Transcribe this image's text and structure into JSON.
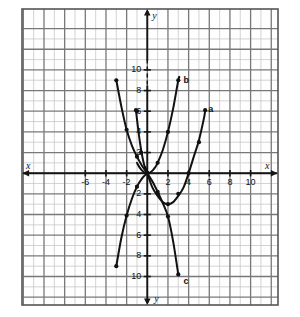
{
  "figure": {
    "kind": "coordinate-grid-plot",
    "background_color": "#ffffff",
    "grid_color": "#b9b9b9",
    "major_grid_color": "#6e6e6e",
    "axis_color": "#1a1a1a",
    "curve_color": "#111111",
    "border_color": "#555555"
  },
  "axes": {
    "x_letter": "x",
    "y_letter": "y",
    "x_letter_left": "x",
    "y_letter_bottom": "y",
    "x_min": -8,
    "x_max": 10,
    "y_min": -11,
    "y_max": 12,
    "x_tick_labels_left": [
      "-6",
      "-4",
      "-2"
    ],
    "x_tick_values_left": [
      -6,
      -4,
      -2
    ],
    "x_tick_labels_right": [
      "2",
      "4",
      "6",
      "8",
      "10"
    ],
    "x_tick_values_right": [
      2,
      4,
      6,
      8,
      10
    ],
    "y_tick_labels_up": [
      "2",
      "4",
      "6",
      "8",
      "10"
    ],
    "y_tick_values_up": [
      2,
      4,
      6,
      8,
      10
    ],
    "y_tick_labels_down": [
      "2",
      "4",
      "6",
      "8",
      "10"
    ],
    "y_tick_values_down": [
      -2,
      -4,
      -6,
      -8,
      -10
    ]
  },
  "curve_labels": [
    {
      "id": "a",
      "text": "a",
      "x": 5.9,
      "y": 6.6
    },
    {
      "id": "b",
      "text": "b",
      "x": 3.5,
      "y": 9.4
    },
    {
      "id": "c",
      "text": "c",
      "x": 3.5,
      "y": -10.0
    }
  ],
  "chart_data": {
    "type": "line",
    "title": "",
    "xlabel": "x",
    "ylabel": "y",
    "xlim": [
      -8,
      10
    ],
    "ylim": [
      -11,
      12
    ],
    "grid": true,
    "legend": "inline-curve-labels",
    "series": [
      {
        "name": "a",
        "label": "a",
        "description": "upward parabola, vertex near (2,-3), passes through origin and (4,0)",
        "marked_points": [
          [
            0,
            0
          ],
          [
            1,
            -2
          ],
          [
            2,
            -3
          ],
          [
            3,
            -2
          ],
          [
            4,
            0
          ],
          [
            5,
            3
          ],
          [
            5.6,
            6.1
          ]
        ],
        "x": [
          -0.2,
          0,
          0.5,
          1,
          1.5,
          2,
          2.5,
          3,
          3.5,
          4,
          4.5,
          5,
          5.5,
          5.6
        ],
        "y": [
          0.6,
          0,
          -1.4,
          -2.2,
          -2.8,
          -3.0,
          -2.8,
          -2.2,
          -1.4,
          0,
          1.6,
          3.2,
          5.4,
          6.1
        ]
      },
      {
        "name": "b",
        "label": "b",
        "description": "narrow upward parabola, vertex at origin, through (1,1),(2,4),(3,9)",
        "marked_points": [
          [
            0,
            0
          ],
          [
            1,
            1
          ],
          [
            2,
            4
          ],
          [
            3,
            9
          ]
        ],
        "x": [
          -1,
          -0.75,
          -0.5,
          -0.25,
          0,
          0.25,
          0.5,
          0.75,
          1,
          1.5,
          2,
          2.5,
          3,
          3.1
        ],
        "y": [
          1,
          0.56,
          0.25,
          0.06,
          0,
          0.06,
          0.25,
          0.56,
          1,
          2.25,
          4,
          6.25,
          9,
          9.3
        ]
      },
      {
        "name": "c",
        "label": "c",
        "description": "downward steep curve from upper-left (-3,9) through origin to lower-right (3,-10)",
        "marked_points": [
          [
            -3,
            9
          ],
          [
            -2,
            4.2
          ],
          [
            -1,
            1.6
          ],
          [
            0,
            0
          ],
          [
            1,
            -1.8
          ],
          [
            2,
            -4.2
          ],
          [
            3,
            -9.8
          ]
        ],
        "x": [
          -3,
          -2.5,
          -2,
          -1.5,
          -1,
          -0.5,
          0,
          0.5,
          1,
          1.5,
          2,
          2.5,
          3
        ],
        "y": [
          9,
          6.4,
          4.2,
          2.7,
          1.6,
          0.7,
          0,
          -0.8,
          -1.8,
          -2.9,
          -4.2,
          -6.6,
          -9.8
        ]
      },
      {
        "name": "d",
        "label": "",
        "description": "rising steep curve from lower-left (-3,-9) through origin up to (-1,6) branch; S-shaped cubic-like pair",
        "marked_points": [
          [
            -3,
            -9
          ],
          [
            -2,
            -4.1
          ],
          [
            -1,
            -1.3
          ],
          [
            0,
            0
          ],
          [
            -1,
            6
          ]
        ],
        "x": [
          -3,
          -2.5,
          -2,
          -1.5,
          -1,
          -0.5,
          0
        ],
        "y": [
          -9,
          -6.2,
          -4.1,
          -2.5,
          -1.3,
          -0.5,
          0
        ]
      },
      {
        "name": "e",
        "label": "",
        "description": "left descending branch from (-1,6) to origin (part of narrow parabola b mirrored / separate steep curve)",
        "marked_points": [
          [
            -1.1,
            6.1
          ],
          [
            -0.6,
            2.0
          ],
          [
            0,
            0
          ]
        ],
        "x": [
          -1.1,
          -0.9,
          -0.7,
          -0.5,
          -0.3,
          -0.1,
          0,
          0.1
        ],
        "y": [
          6.1,
          4.4,
          2.9,
          1.7,
          0.8,
          0.15,
          0,
          -0.1
        ]
      }
    ]
  }
}
